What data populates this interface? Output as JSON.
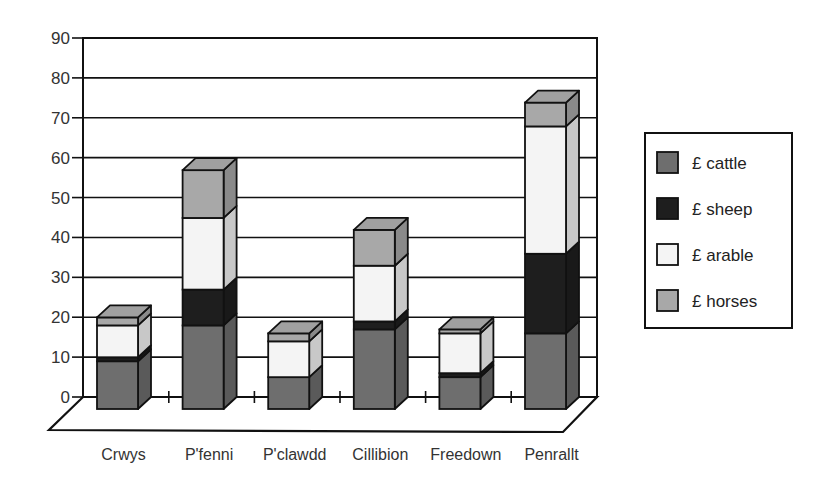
{
  "chart_data": {
    "type": "bar",
    "stacked": true,
    "three_d": true,
    "title": "",
    "xlabel": "",
    "ylabel": "",
    "ylim": [
      0,
      90
    ],
    "yticks": [
      0,
      10,
      20,
      30,
      40,
      50,
      60,
      70,
      80,
      90
    ],
    "grid": true,
    "legend_position": "right",
    "categories": [
      "Crwys",
      "P'fenni",
      "P'clawdd",
      "Cillibion",
      "Freedown",
      "Penrallt"
    ],
    "series": [
      {
        "name": "£ cattle",
        "color": "#6e6e6e",
        "values": [
          12,
          21,
          8,
          20,
          8,
          19
        ]
      },
      {
        "name": "£ sheep",
        "color": "#1e1e1e",
        "values": [
          1,
          9,
          0,
          2,
          1,
          20
        ]
      },
      {
        "name": "£ arable",
        "color": "#f4f4f4",
        "values": [
          8,
          18,
          9,
          14,
          10,
          32
        ]
      },
      {
        "name": "£ horses",
        "color": "#a8a8a8",
        "values": [
          2,
          12,
          2,
          9,
          1,
          6
        ]
      }
    ]
  },
  "legend": {
    "items": [
      {
        "label": "£  cattle",
        "color": "#6e6e6e"
      },
      {
        "label": "£ sheep",
        "color": "#1e1e1e"
      },
      {
        "label": "£  arable",
        "color": "#f4f4f4"
      },
      {
        "label": "£  horses",
        "color": "#a8a8a8"
      }
    ]
  }
}
